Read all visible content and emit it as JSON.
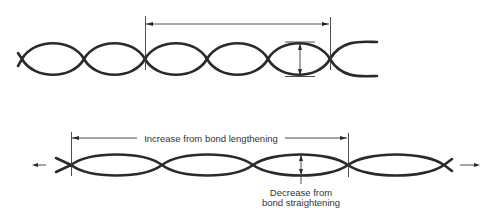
{
  "diagram": {
    "type": "helix-extension-illustration",
    "top_helix": {
      "description": "Relaxed helix (before stretching)",
      "crossings_x": [
        22,
        84,
        145,
        207,
        268,
        330
      ],
      "center_y": 59,
      "amplitude": 17,
      "period_marker": {
        "from_x": 145,
        "to_x": 330,
        "y": 24
      },
      "diameter_marker": {
        "x": 300,
        "top_y": 42,
        "bottom_y": 76
      }
    },
    "bottom_helix": {
      "description": "Stretched helix (under tension)",
      "crossings_x": [
        71,
        162,
        253,
        348,
        444
      ],
      "center_y": 165,
      "amplitude": 10,
      "length_marker": {
        "from_x": 71,
        "to_x": 348,
        "y": 138,
        "label": "Increase from bond lengthening"
      },
      "diameter_marker": {
        "x": 301,
        "top_y": 155,
        "bottom_y": 175,
        "label_line1": "Decrease from",
        "label_line2": "bond straightening"
      },
      "tension_arrows": {
        "left": "pull-left",
        "right": "pull-right"
      }
    },
    "colors": {
      "stroke": "#2a2a2a",
      "background": "#ffffff"
    }
  }
}
